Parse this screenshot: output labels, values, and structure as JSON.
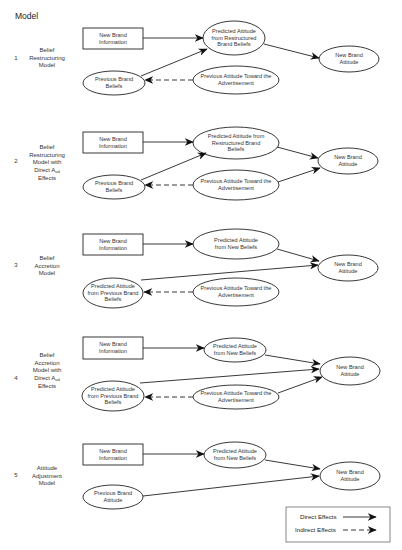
{
  "header": {
    "title": "Model"
  },
  "models": [
    {
      "number": "1",
      "label_lines": [
        "Belief",
        "Restructuring",
        "Model"
      ],
      "nodes": {
        "info": "New Brand Information",
        "predicted": "Predicted Attitude from Restructured Brand Beliefs",
        "previous": "Previous Brand Beliefs",
        "aad": "Previous Attitude Toward the Advertisement",
        "outcome": "New Brand Attitude"
      }
    },
    {
      "number": "2",
      "label_lines": [
        "Belief",
        "Restructuring",
        "Model with",
        "Direct A",
        "Effects"
      ],
      "label_subscript": "ad",
      "nodes": {
        "info": "New Brand Information",
        "predicted": "Predicted Attitude from Restructured Brand Beliefs",
        "previous": "Previous Brand Beliefs",
        "aad": "Previous Attitude Toward the Advertisement",
        "outcome": "New Brand Attitude"
      }
    },
    {
      "number": "3",
      "label_lines": [
        "Belief",
        "Accretion",
        "Model"
      ],
      "nodes": {
        "info": "New Brand Information",
        "predicted": "Predicted Attitude from New Beliefs",
        "previous": "Predicted Attitude from Previous Brand Beliefs",
        "aad": "Previous Attitude Toward the Advertisement",
        "outcome": "New Brand Attitude"
      }
    },
    {
      "number": "4",
      "label_lines": [
        "Belief",
        "Accretion",
        "Model with",
        "Direct A",
        "Effects"
      ],
      "label_subscript": "ad",
      "nodes": {
        "info": "New Brand Information",
        "predicted": "Predicted Attitude from New Beliefs",
        "previous": "Predicted Attitude from Previous Brand Beliefs",
        "aad": "Previous Attitude Toward the Advertisement",
        "outcome": "New Brand Attitude"
      }
    },
    {
      "number": "5",
      "label_lines": [
        "Attitude",
        "Adjustment",
        "Model"
      ],
      "nodes": {
        "info": "New Brand Information",
        "predicted": "Predicted Attitude from New Beliefs",
        "previous": "Previous Brand Attitude",
        "outcome": "New Brand Attitude"
      }
    }
  ],
  "edges": [
    {
      "model": 1,
      "from": "New Brand Information",
      "to": "Predicted Attitude from Restructured Brand Beliefs",
      "type": "direct"
    },
    {
      "model": 1,
      "from": "Previous Brand Beliefs",
      "to": "Predicted Attitude from Restructured Brand Beliefs",
      "type": "direct"
    },
    {
      "model": 1,
      "from": "Previous Attitude Toward the Advertisement",
      "to": "Previous Brand Beliefs",
      "type": "indirect"
    },
    {
      "model": 1,
      "from": "Predicted Attitude from Restructured Brand Beliefs",
      "to": "New Brand Attitude",
      "type": "direct"
    },
    {
      "model": 2,
      "from": "New Brand Information",
      "to": "Predicted Attitude from Restructured Brand Beliefs",
      "type": "direct"
    },
    {
      "model": 2,
      "from": "Previous Brand Beliefs",
      "to": "Predicted Attitude from Restructured Brand Beliefs",
      "type": "direct"
    },
    {
      "model": 2,
      "from": "Previous Attitude Toward the Advertisement",
      "to": "Previous Brand Beliefs",
      "type": "indirect"
    },
    {
      "model": 2,
      "from": "Predicted Attitude from Restructured Brand Beliefs",
      "to": "New Brand Attitude",
      "type": "direct"
    },
    {
      "model": 2,
      "from": "Previous Attitude Toward the Advertisement",
      "to": "New Brand Attitude",
      "type": "direct"
    },
    {
      "model": 3,
      "from": "New Brand Information",
      "to": "Predicted Attitude from New Beliefs",
      "type": "direct"
    },
    {
      "model": 3,
      "from": "Predicted Attitude from New Beliefs",
      "to": "New Brand Attitude",
      "type": "direct"
    },
    {
      "model": 3,
      "from": "Predicted Attitude from Previous Brand Beliefs",
      "to": "New Brand Attitude",
      "type": "direct"
    },
    {
      "model": 3,
      "from": "Previous Attitude Toward the Advertisement",
      "to": "Predicted Attitude from Previous Brand Beliefs",
      "type": "indirect"
    },
    {
      "model": 4,
      "from": "New Brand Information",
      "to": "Predicted Attitude from New Beliefs",
      "type": "direct"
    },
    {
      "model": 4,
      "from": "Predicted Attitude from New Beliefs",
      "to": "New Brand Attitude",
      "type": "direct"
    },
    {
      "model": 4,
      "from": "Predicted Attitude from Previous Brand Beliefs",
      "to": "New Brand Attitude",
      "type": "direct"
    },
    {
      "model": 4,
      "from": "Previous Attitude Toward the Advertisement",
      "to": "Predicted Attitude from Previous Brand Beliefs",
      "type": "indirect"
    },
    {
      "model": 4,
      "from": "Previous Attitude Toward the Advertisement",
      "to": "New Brand Attitude",
      "type": "direct"
    },
    {
      "model": 5,
      "from": "New Brand Information",
      "to": "Predicted Attitude from New Beliefs",
      "type": "direct"
    },
    {
      "model": 5,
      "from": "Predicted Attitude from New Beliefs",
      "to": "New Brand Attitude",
      "type": "direct"
    },
    {
      "model": 5,
      "from": "Previous Brand Attitude",
      "to": "New Brand Attitude",
      "type": "direct"
    }
  ],
  "legend": {
    "direct": "Direct Effects",
    "indirect": "Indirect Effects"
  },
  "colors": {
    "stroke": "#222222",
    "background": "#ffffff"
  }
}
